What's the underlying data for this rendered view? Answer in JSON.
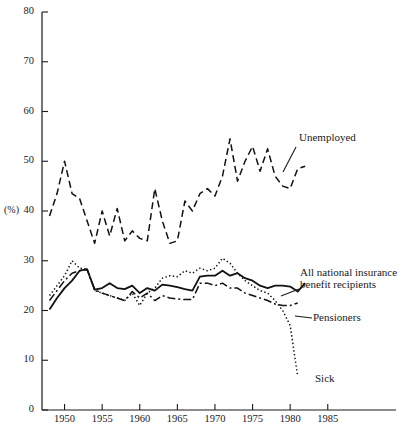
{
  "chart_data": {
    "type": "line",
    "title": "",
    "xlabel": "",
    "ylabel": "(%)",
    "xlim": [
      1947,
      1988
    ],
    "ylim": [
      0,
      80
    ],
    "grid": false,
    "legend_position": "inline-annotations",
    "y_ticks": [
      0,
      10,
      20,
      30,
      40,
      50,
      60,
      70,
      80
    ],
    "x_ticks": [
      1950,
      1955,
      1960,
      1965,
      1970,
      1975,
      1980,
      1985
    ],
    "series": [
      {
        "name": "Unemployed",
        "style": "dashed",
        "color": "#111111",
        "label_x": 1981,
        "label_y": 55,
        "x": [
          1948,
          1949,
          1950,
          1951,
          1952,
          1953,
          1954,
          1955,
          1956,
          1957,
          1958,
          1959,
          1960,
          1961,
          1962,
          1963,
          1964,
          1965,
          1966,
          1967,
          1968,
          1969,
          1970,
          1971,
          1972,
          1973,
          1974,
          1975,
          1976,
          1977,
          1978,
          1979,
          1980,
          1981,
          1982
        ],
        "values": [
          39.0,
          43.5,
          50.0,
          43.5,
          42.5,
          38.0,
          33.5,
          40.0,
          35.0,
          40.5,
          34.0,
          36.0,
          34.5,
          34.0,
          44.5,
          38.0,
          33.5,
          34.0,
          42.0,
          40.0,
          43.5,
          44.5,
          43.0,
          47.0,
          54.5,
          46.0,
          50.0,
          53.0,
          48.0,
          52.5,
          47.0,
          45.0,
          44.5,
          48.5,
          49.0
        ]
      },
      {
        "name": "All national insurance benefit recipients",
        "style": "solid",
        "color": "#111111",
        "label_x": 1978,
        "label_y": 27.5,
        "x": [
          1948,
          1949,
          1950,
          1951,
          1952,
          1953,
          1954,
          1955,
          1956,
          1957,
          1958,
          1959,
          1960,
          1961,
          1962,
          1963,
          1964,
          1965,
          1966,
          1967,
          1968,
          1969,
          1970,
          1971,
          1972,
          1973,
          1974,
          1975,
          1976,
          1977,
          1978,
          1979,
          1980,
          1981,
          1982
        ],
        "values": [
          20.2,
          22.5,
          24.5,
          26.0,
          28.0,
          28.3,
          24.2,
          24.5,
          25.5,
          24.5,
          24.3,
          25.0,
          23.5,
          24.5,
          24.0,
          25.2,
          25.0,
          24.7,
          24.3,
          24.0,
          26.8,
          27.0,
          27.0,
          28.0,
          27.0,
          27.5,
          26.5,
          26.0,
          25.0,
          24.5,
          25.0,
          25.0,
          24.8,
          23.8,
          25.5
        ]
      },
      {
        "name": "Sick",
        "style": "dotted",
        "color": "#111111",
        "label_x": 1981,
        "label_y": 7,
        "x": [
          1948,
          1949,
          1950,
          1951,
          1952,
          1953,
          1954,
          1955,
          1956,
          1957,
          1958,
          1959,
          1960,
          1961,
          1962,
          1963,
          1964,
          1965,
          1966,
          1967,
          1968,
          1969,
          1970,
          1971,
          1972,
          1973,
          1974,
          1975,
          1976,
          1977,
          1978,
          1979,
          1980,
          1981
        ],
        "values": [
          23.0,
          25.0,
          27.0,
          30.0,
          28.5,
          28.3,
          24.0,
          23.5,
          23.0,
          22.5,
          22.0,
          23.5,
          21.0,
          23.5,
          24.5,
          26.5,
          27.0,
          26.8,
          28.0,
          27.5,
          28.5,
          28.0,
          28.5,
          30.5,
          29.5,
          27.5,
          26.0,
          25.0,
          24.0,
          23.5,
          22.0,
          20.0,
          17.0,
          6.8
        ]
      },
      {
        "name": "Pensioners",
        "style": "dashdot",
        "color": "#111111",
        "label_x": 1978,
        "label_y": 20.5,
        "x": [
          1948,
          1949,
          1950,
          1951,
          1952,
          1953,
          1954,
          1955,
          1956,
          1957,
          1958,
          1959,
          1960,
          1961,
          1962,
          1963,
          1964,
          1965,
          1966,
          1967,
          1968,
          1969,
          1970,
          1971,
          1972,
          1973,
          1974,
          1975,
          1976,
          1977,
          1978,
          1979,
          1980,
          1981
        ],
        "values": [
          22.0,
          24.0,
          26.0,
          27.5,
          28.0,
          28.2,
          24.2,
          23.5,
          23.0,
          22.5,
          22.0,
          23.8,
          22.5,
          23.5,
          22.0,
          23.0,
          22.5,
          22.3,
          22.2,
          22.2,
          25.5,
          25.5,
          25.0,
          25.5,
          24.5,
          24.5,
          23.5,
          23.0,
          22.5,
          22.0,
          21.3,
          21.0,
          21.0,
          21.5
        ]
      }
    ]
  },
  "labels": {
    "y_axis_title": "(%)",
    "unemployed": "Unemployed",
    "all_ni_line1": "All national insurance",
    "all_ni_line2": "benefit recipients",
    "pensioners": "Pensioners",
    "sick": "Sick"
  }
}
